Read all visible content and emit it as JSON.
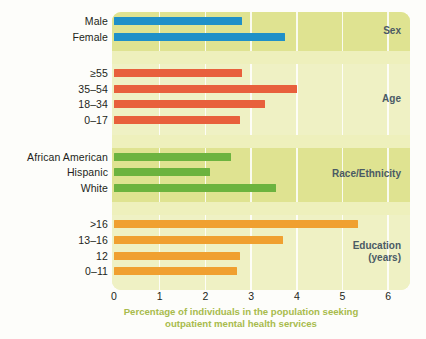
{
  "chart_data": {
    "type": "bar",
    "orientation": "horizontal",
    "title": "",
    "xlabel": "Percentage of individuals in the population seeking outpatient mental health services",
    "ylabel": "",
    "xlim": [
      0,
      6
    ],
    "xticks": [
      "0",
      "1",
      "2",
      "3",
      "4",
      "5",
      "6"
    ],
    "grid": true,
    "legend": "none",
    "groups": [
      {
        "name": "Sex",
        "label_lines": [
          "Sex"
        ],
        "color": "#1f90c8",
        "panel": "dark",
        "categories": [
          "Male",
          "Female"
        ],
        "values": [
          2.8,
          3.75
        ]
      },
      {
        "name": "Age",
        "label_lines": [
          "Age"
        ],
        "color": "#e8603c",
        "panel": "light",
        "categories": [
          "≥55",
          "35–54",
          "18–34",
          "0–17"
        ],
        "values": [
          2.8,
          4.0,
          3.3,
          2.75
        ]
      },
      {
        "name": "Race/Ethnicity",
        "label_lines": [
          "Race/Ethnicity"
        ],
        "color": "#6cb33f",
        "panel": "dark",
        "categories": [
          "African American",
          "Hispanic",
          "White"
        ],
        "values": [
          2.55,
          2.1,
          3.55
        ]
      },
      {
        "name": "Education (years)",
        "label_lines": [
          "Education",
          "(years)"
        ],
        "color": "#f0a030",
        "panel": "light",
        "categories": [
          ">16",
          "13–16",
          "12",
          "0–11"
        ],
        "values": [
          5.35,
          3.7,
          2.75,
          2.7
        ]
      }
    ]
  },
  "axis": {
    "title_line_1": "Percentage of individuals in the population seeking",
    "title_line_2": "outpatient mental health services",
    "title_color": "#a8bb4c"
  },
  "colors": {
    "panel_dark": "#dfe391",
    "panel_light": "#eff1c4",
    "gridline": "#ffffff",
    "label_text": "#231f20",
    "group_label_text": "#4a5a64",
    "background": "#fdfdfa"
  }
}
